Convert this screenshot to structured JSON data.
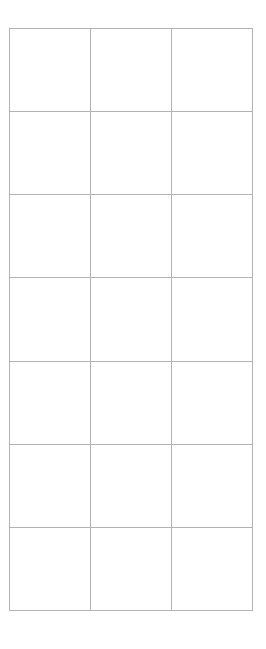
{
  "document": {
    "type": "grid-table",
    "background_color": "#ffffff",
    "border_color": "#b3b3b3",
    "border_width_px": 1
  },
  "table": {
    "columns": 3,
    "rows": 7,
    "column_headers": [
      "",
      "",
      ""
    ],
    "cells": [
      [
        "",
        "",
        ""
      ],
      [
        "",
        "",
        ""
      ],
      [
        "",
        "",
        ""
      ],
      [
        "",
        "",
        ""
      ],
      [
        "",
        "",
        ""
      ],
      [
        "",
        "",
        ""
      ],
      [
        "",
        "",
        ""
      ]
    ],
    "bounds": {
      "left_px": 9,
      "top_px": 28,
      "width_px": 240,
      "height_px": 582
    },
    "cell_size": {
      "width_px": 80,
      "height_px": 83
    }
  }
}
